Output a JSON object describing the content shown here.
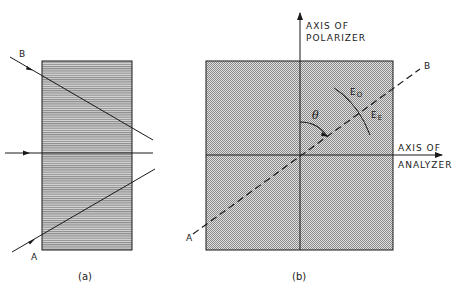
{
  "panel_a": {
    "caption": "(a)",
    "ray_b_label": "B",
    "ray_a_label": "A"
  },
  "panel_b": {
    "caption": "(b)",
    "polarizer_axis_line1": "AXIS OF",
    "polarizer_axis_line2": "POLARIZER",
    "analyzer_axis_line1": "AXIS OF",
    "analyzer_axis_line2": "ANALYZER",
    "angle_label": "θ",
    "ordinary_label": "E",
    "ordinary_sub": "O",
    "extraordinary_label": "E",
    "extraordinary_sub": "E",
    "line_end_b": "B",
    "line_end_a": "A"
  },
  "colors": {
    "ink": "#1a1a1a",
    "fill_a": "#9a9a9a",
    "fill_b": "#b5b5b5"
  }
}
